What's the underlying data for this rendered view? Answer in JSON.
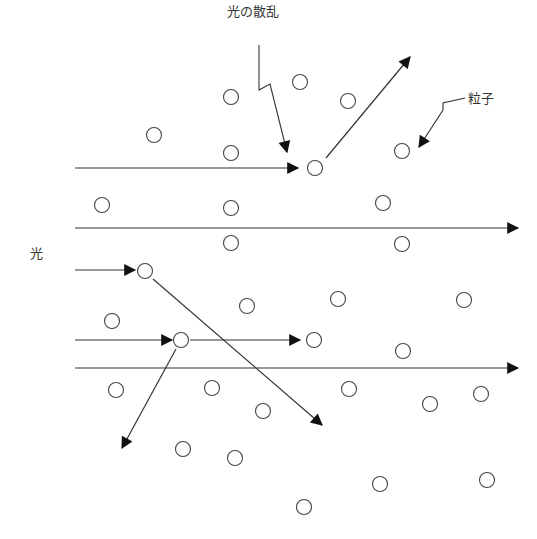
{
  "labels": {
    "scattering": "光の散乱",
    "particle": "粒子",
    "light": "光"
  },
  "colors": {
    "stroke": "#333333",
    "particle_fill": "#ffffff"
  },
  "particles": [
    [
      231,
      97
    ],
    [
      300,
      82
    ],
    [
      348,
      101
    ],
    [
      154,
      135
    ],
    [
      231,
      153
    ],
    [
      315,
      168
    ],
    [
      402,
      151
    ],
    [
      102,
      205
    ],
    [
      231,
      208
    ],
    [
      383,
      203
    ],
    [
      231,
      243
    ],
    [
      402,
      244
    ],
    [
      145,
      271
    ],
    [
      247,
      306
    ],
    [
      338,
      299
    ],
    [
      464,
      300
    ],
    [
      112,
      321
    ],
    [
      181,
      340
    ],
    [
      314,
      340
    ],
    [
      403,
      351
    ],
    [
      116,
      390
    ],
    [
      212,
      388
    ],
    [
      349,
      389
    ],
    [
      263,
      411
    ],
    [
      430,
      404
    ],
    [
      481,
      394
    ],
    [
      183,
      449
    ],
    [
      235,
      458
    ],
    [
      380,
      484
    ],
    [
      487,
      480
    ],
    [
      304,
      507
    ]
  ],
  "rays": [
    {
      "x1": 75,
      "y1": 168,
      "x2": 298,
      "y2": 168,
      "arrow": true
    },
    {
      "x1": 326,
      "y1": 158,
      "x2": 410,
      "y2": 57,
      "arrow": true
    },
    {
      "x1": 75,
      "y1": 228,
      "x2": 518,
      "y2": 228,
      "arrow": true
    },
    {
      "x1": 75,
      "y1": 270,
      "x2": 135,
      "y2": 270,
      "arrow": true
    },
    {
      "x1": 153,
      "y1": 279,
      "x2": 322,
      "y2": 425,
      "arrow": true
    },
    {
      "x1": 75,
      "y1": 340,
      "x2": 172,
      "y2": 340,
      "arrow": true
    },
    {
      "x1": 190,
      "y1": 340,
      "x2": 300,
      "y2": 340,
      "arrow": true
    },
    {
      "x1": 176,
      "y1": 349,
      "x2": 122,
      "y2": 448,
      "arrow": true
    },
    {
      "x1": 75,
      "y1": 368,
      "x2": 518,
      "y2": 368,
      "arrow": true
    }
  ],
  "callouts": [
    {
      "name": "scattering-callout",
      "points": "259,45 259,90 270,84 287,152",
      "arrow": true
    },
    {
      "name": "particle-callout",
      "points": "465,98 443,103 443,110 419,147",
      "arrow": true
    }
  ]
}
